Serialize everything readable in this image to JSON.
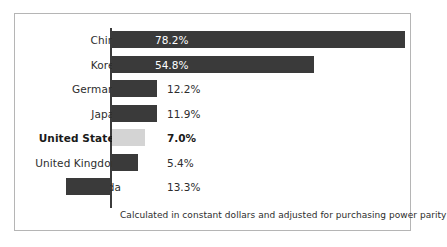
{
  "chart_data": {
    "type": "bar",
    "orientation": "horizontal",
    "title": "",
    "xlabel": "",
    "ylabel": "",
    "footnote": "Calculated in constant dollars and adjusted for purchasing power parity",
    "grid": false,
    "legend": false,
    "categories": [
      "China",
      "Korea",
      "Germany",
      "Japan",
      "United States",
      "United Kingdom",
      "Canada"
    ],
    "values": [
      78.2,
      54.8,
      12.2,
      11.9,
      7.0,
      5.4,
      13.3
    ],
    "value_labels": [
      "78.2%",
      "54.8%",
      "12.2%",
      "11.9%",
      "7.0%",
      "5.4%",
      "13.3%"
    ],
    "xlim": [
      0,
      80
    ],
    "colors": {
      "bar_dark": "#3a3a3a",
      "bar_light": "#d4d4d4",
      "axis": "#3b3b3b",
      "frame_border": "#b5b5b5",
      "background": "#ffffff",
      "label_text": "#2d2d2d",
      "inside_label_text": "#ffffff"
    },
    "rows": [
      {
        "label": "China",
        "value": 78.2,
        "value_label": "78.2%",
        "bar_width_px": 293,
        "bar_direction": "right",
        "bar_style": "dark",
        "label_inside_bar": true,
        "highlight": false
      },
      {
        "label": "Korea",
        "value": 54.8,
        "value_label": "54.8%",
        "bar_width_px": 202,
        "bar_direction": "right",
        "bar_style": "dark",
        "label_inside_bar": true,
        "highlight": false
      },
      {
        "label": "Germany",
        "value": 12.2,
        "value_label": "12.2%",
        "bar_width_px": 45,
        "bar_direction": "right",
        "bar_style": "dark",
        "label_inside_bar": false,
        "highlight": false
      },
      {
        "label": "Japan",
        "value": 11.9,
        "value_label": "11.9%",
        "bar_width_px": 45,
        "bar_direction": "right",
        "bar_style": "dark",
        "label_inside_bar": false,
        "highlight": false
      },
      {
        "label": "United States",
        "value": 7.0,
        "value_label": "7.0%",
        "bar_width_px": 33,
        "bar_direction": "right",
        "bar_style": "light",
        "label_inside_bar": false,
        "highlight": true
      },
      {
        "label": "United Kingdom",
        "value": 5.4,
        "value_label": "5.4%",
        "bar_width_px": 26,
        "bar_direction": "right",
        "bar_style": "dark",
        "label_inside_bar": false,
        "highlight": false
      },
      {
        "label": "Canada",
        "value": 13.3,
        "value_label": "13.3%",
        "bar_width_px": 44,
        "bar_direction": "left",
        "bar_style": "dark",
        "label_inside_bar": false,
        "highlight": false
      }
    ]
  }
}
